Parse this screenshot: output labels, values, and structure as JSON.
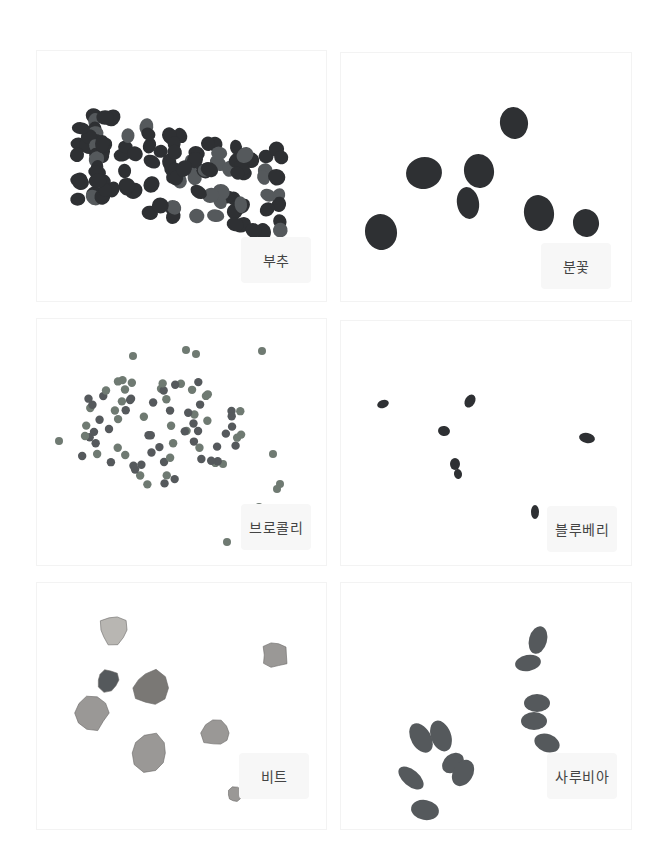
{
  "panels": [
    {
      "id": "buchu",
      "label": "부추",
      "seed_type": "dense-cluster-dark"
    },
    {
      "id": "bunkkot",
      "label": "분꽃",
      "seed_type": "large-rough-dark"
    },
    {
      "id": "broccoli",
      "label": "브로콜리",
      "seed_type": "small-round-green-grey"
    },
    {
      "id": "blueberry",
      "label": "블루베리",
      "seed_type": "tiny-dark"
    },
    {
      "id": "beet",
      "label": "비트",
      "seed_type": "irregular-light"
    },
    {
      "id": "salvia",
      "label": "사루비아",
      "seed_type": "oval-dark"
    }
  ],
  "colors": {
    "background": "#ffffff",
    "label_bg": "#f7f7f7",
    "label_text": "#444444",
    "seed_dark": "#2e3033",
    "seed_mid": "#55595c",
    "seed_green": "#6f7a72",
    "seed_light": "#9a9896"
  }
}
